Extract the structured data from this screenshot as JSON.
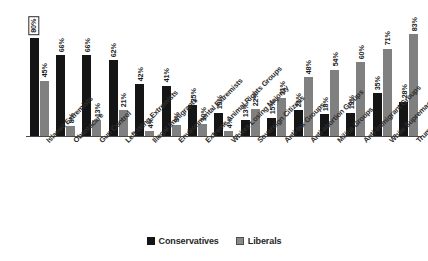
{
  "chart_data": {
    "type": "bar",
    "title": "",
    "subtitle": "",
    "xlabel": "",
    "ylabel": "",
    "ylim": [
      0,
      100
    ],
    "grid": false,
    "legend_position": "bottom",
    "categories": [
      "Islamic Extremists",
      "Obamacare",
      "Gun Control",
      "Left-Wing Extremists",
      "Illegal Immigrants",
      "Environmental Extremists",
      "Extreme Animal Rights Groups",
      "Whites Losing Majority",
      "Sovereign Citizens",
      "Anti-tax Groups",
      "Anti-abortion Groups",
      "Militia Groups",
      "Anti-Immigrant Groups",
      "White Supremacists",
      "Trumpcare"
    ],
    "series": [
      {
        "name": "Conservatives",
        "color": "#151515",
        "values": [
          80,
          66,
          66,
          62,
          42,
          41,
          25,
          19,
          13,
          15,
          21,
          18,
          19,
          35,
          28
        ],
        "labels": [
          "80%",
          "66%",
          "66%",
          "62%",
          "42%",
          "41%",
          "25%",
          "19%",
          "13%",
          "15%",
          "21%",
          "18%",
          "19%",
          "35%",
          "28%"
        ]
      },
      {
        "name": "Liberals",
        "color": "#808080",
        "values": [
          45,
          8,
          13,
          21,
          4,
          9,
          10,
          4,
          22,
          31,
          48,
          54,
          60,
          71,
          83
        ],
        "labels": [
          "45%",
          "8%",
          "13%",
          "21%",
          "4%",
          "9%",
          "10%",
          "4%",
          "22%",
          "31%",
          "48%",
          "54%",
          "60%",
          "71%",
          "83%"
        ]
      }
    ]
  },
  "legend": {
    "items": [
      {
        "label": "Conservatives",
        "swatch": "cons"
      },
      {
        "label": "Liberals",
        "swatch": "libs"
      }
    ]
  }
}
